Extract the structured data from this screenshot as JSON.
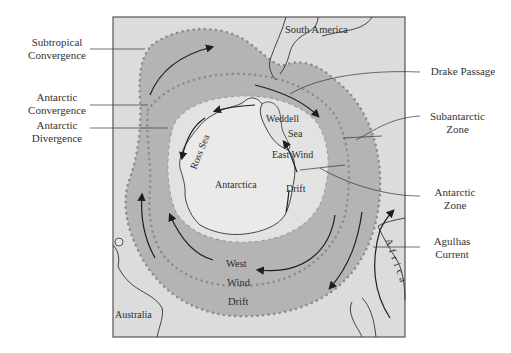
{
  "figure": {
    "type": "map-diagram",
    "colors": {
      "background": "#ffffff",
      "sea": "#dcdcdc",
      "current_band": "#b4b4b4",
      "land_antarctica": "#e9e9e9",
      "frame": "#555555",
      "convergence_dots": "#8c8c8c",
      "divergence_circles": "#9a9a9a",
      "arrows": "#1e1e1e"
    }
  },
  "map_labels": {
    "south_america": "South America",
    "weddell": "Weddell",
    "sea": "Sea",
    "ross_sea": "Ross Sea",
    "antarctica": "Antarctica",
    "east_wind": "East Wind",
    "east_drift": "Drift",
    "west": "West",
    "wind": "Wind",
    "west_drift": "Drift",
    "australia": "Australia",
    "africa": "Africa"
  },
  "callouts": {
    "subtropical_convergence": [
      "Subtropical",
      "Convergence"
    ],
    "antarctic_convergence": [
      "Antarctic",
      "Convergence"
    ],
    "antarctic_divergence": [
      "Antarctic",
      "Divergence"
    ],
    "drake_passage": [
      "Drake Passage"
    ],
    "subantarctic_zone": [
      "Subantarctic",
      "Zone"
    ],
    "antarctic_zone": [
      "Antarctic",
      "Zone"
    ],
    "agulhas_current": [
      "Agulhas",
      "Current"
    ]
  }
}
